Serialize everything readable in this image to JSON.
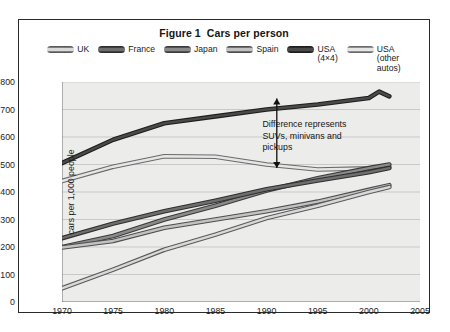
{
  "figure": {
    "title": "Figure 1  Cars per person",
    "border_color": "#2a2a2a",
    "plot_background": "#ececeb"
  },
  "legend": {
    "items": [
      {
        "label": "UK",
        "color": "#d9d9d9",
        "edge": "#5a5a5a"
      },
      {
        "label": "France",
        "color": "#6e6e6e",
        "edge": "#2e2e2e"
      },
      {
        "label": "Japan",
        "color": "#8a8a8a",
        "edge": "#3a3a3a"
      },
      {
        "label": "Spain",
        "color": "#c2c2c2",
        "edge": "#4e4e4e"
      },
      {
        "label": "USA\n(4×4)",
        "color": "#4a4a4a",
        "edge": "#1d1d1d"
      },
      {
        "label": "USA\n(other\nautos)",
        "color": "#e6e6e6",
        "edge": "#6a6a6a"
      }
    ]
  },
  "annotation": {
    "text": "Difference represents\nSUVs, minivans and\npickups",
    "arrow_x_year": 1991,
    "arrow_top_value": 740,
    "arrow_bottom_value": 487
  },
  "chart_data": {
    "type": "line",
    "title": "Figure 1  Cars per person",
    "xlabel": "",
    "ylabel": "cars per 1,000 people",
    "xlim": [
      1970,
      2005
    ],
    "ylim": [
      0,
      800
    ],
    "xticks": [
      1970,
      1975,
      1980,
      1985,
      1990,
      1995,
      2000,
      2005
    ],
    "yticks": [
      0,
      100,
      200,
      300,
      400,
      500,
      600,
      700,
      800
    ],
    "grid": "horizontal",
    "legend_position": "top",
    "series": [
      {
        "name": "USA (4×4)",
        "color": "#4a4a4a",
        "edge": "#1d1d1d",
        "x": [
          1970,
          1975,
          1980,
          1985,
          1990,
          1995,
          2000,
          2001,
          2002
        ],
        "values": [
          505,
          590,
          650,
          675,
          700,
          718,
          742,
          765,
          748
        ]
      },
      {
        "name": "USA (other autos)",
        "color": "#e6e6e6",
        "edge": "#6a6a6a",
        "x": [
          1970,
          1975,
          1980,
          1985,
          1990,
          1995,
          2000,
          2002
        ],
        "values": [
          440,
          492,
          530,
          528,
          500,
          482,
          486,
          492
        ]
      },
      {
        "name": "Japan",
        "color": "#8a8a8a",
        "edge": "#3a3a3a",
        "x": [
          1970,
          1975,
          1980,
          1985,
          1990,
          1995,
          2000,
          2002
        ],
        "values": [
          200,
          240,
          300,
          350,
          405,
          450,
          487,
          500
        ]
      },
      {
        "name": "France",
        "color": "#6e6e6e",
        "edge": "#2e2e2e",
        "x": [
          1970,
          1975,
          1980,
          1985,
          1990,
          1995,
          2000,
          2002
        ],
        "values": [
          232,
          285,
          330,
          368,
          410,
          442,
          472,
          487
        ]
      },
      {
        "name": "Spain",
        "color": "#c2c2c2",
        "edge": "#4e4e4e",
        "x": [
          1970,
          1975,
          1980,
          1985,
          1990,
          1995,
          2000,
          2002
        ],
        "values": [
          198,
          222,
          270,
          300,
          330,
          365,
          408,
          425
        ]
      },
      {
        "name": "UK",
        "color": "#d9d9d9",
        "edge": "#5a5a5a",
        "x": [
          1970,
          1975,
          1980,
          1985,
          1990,
          1995,
          2000,
          2002
        ],
        "values": [
          50,
          118,
          190,
          245,
          305,
          350,
          400,
          418
        ]
      }
    ]
  }
}
